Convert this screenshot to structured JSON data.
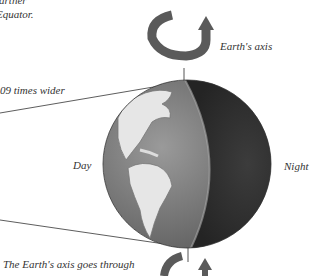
{
  "labels": {
    "top_left_line1": "farther",
    "top_left_line2": "Equator.",
    "width_note": "09 times wider",
    "earth_axis": "Earth's axis",
    "day": "Day",
    "night": "Night",
    "bottom_caption": "The Earth's axis goes through"
  },
  "colors": {
    "day_side": "#8a8a8a",
    "night_side": "#3a3a3a",
    "land": "#e8e8e8",
    "arrow": "#555555",
    "text": "#333333"
  },
  "icons": [
    "rotation-arrow-top-icon",
    "rotation-arrow-bottom-icon"
  ]
}
